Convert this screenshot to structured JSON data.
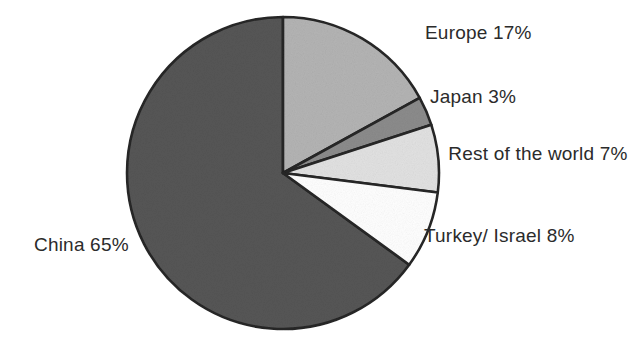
{
  "chart_data": {
    "type": "pie",
    "title": "",
    "categories": [
      "Europe",
      "Japan",
      "Rest of the world",
      "Turkey/ Israel",
      "China"
    ],
    "values": [
      17,
      3,
      7,
      8,
      65
    ],
    "unit": "%",
    "start_angle_deg": 0,
    "direction": "clockwise",
    "legend": "none",
    "labels_position": "outside",
    "slice_colors": [
      "#b4b4b4",
      "#8c8c8c",
      "#e2e2e2",
      "#ffffff",
      "#565656"
    ],
    "outline_color": "#262626",
    "background": "#ffffff",
    "slices": [
      {
        "name": "Europe",
        "value": 17,
        "label": "Europe 17%",
        "color": "#b4b4b4"
      },
      {
        "name": "Japan",
        "value": 3,
        "label": "Japan 3%",
        "color": "#8c8c8c"
      },
      {
        "name": "Rest of the world",
        "value": 7,
        "label": "Rest of the world 7%",
        "color": "#e2e2e2"
      },
      {
        "name": "Turkey/ Israel",
        "value": 8,
        "label": "Turkey/ Israel 8%",
        "color": "#ffffff"
      },
      {
        "name": "China",
        "value": 65,
        "label": "China 65%",
        "color": "#565656"
      }
    ]
  },
  "labels": {
    "europe": "Europe 17%",
    "japan": "Japan 3%",
    "rest_of_world": "Rest of the world 7%",
    "turkey_israel": "Turkey/ Israel 8%",
    "china": "China 65%"
  },
  "geometry": {
    "center_x": 283,
    "center_y": 173,
    "radius": 156
  }
}
